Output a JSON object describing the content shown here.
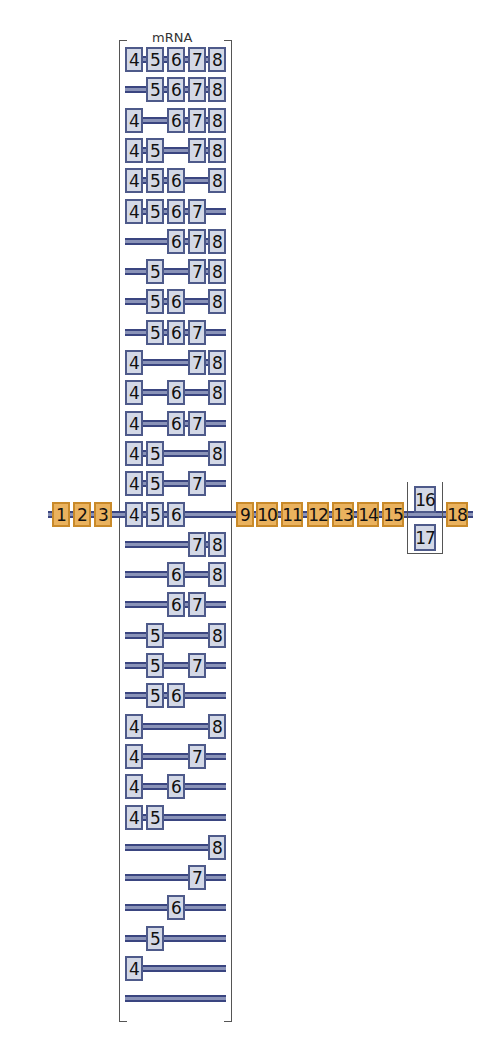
{
  "title": "mRNA",
  "colors": {
    "constitutive_exon": "#eab25e",
    "variable_exon": "#d3d8e6",
    "intron_line": "#3a4580"
  },
  "gene": {
    "constitutive_left": [
      "1",
      "2",
      "3"
    ],
    "constitutive_right": [
      "9",
      "10",
      "11",
      "12",
      "13",
      "14",
      "15"
    ],
    "mutually_exclusive": [
      "16",
      "17"
    ],
    "last_exon": "18"
  },
  "mrna_variants": [
    [
      "4",
      "5",
      "6",
      "7",
      "8"
    ],
    [
      "5",
      "6",
      "7",
      "8"
    ],
    [
      "4",
      "6",
      "7",
      "8"
    ],
    [
      "4",
      "5",
      "7",
      "8"
    ],
    [
      "4",
      "5",
      "6",
      "8"
    ],
    [
      "4",
      "5",
      "6",
      "7"
    ],
    [
      "6",
      "7",
      "8"
    ],
    [
      "5",
      "7",
      "8"
    ],
    [
      "5",
      "6",
      "8"
    ],
    [
      "5",
      "6",
      "7"
    ],
    [
      "4",
      "7",
      "8"
    ],
    [
      "4",
      "6",
      "8"
    ],
    [
      "4",
      "6",
      "7"
    ],
    [
      "4",
      "5",
      "8"
    ],
    [
      "4",
      "5",
      "7"
    ],
    [
      "4",
      "5",
      "6"
    ],
    [
      "7",
      "8"
    ],
    [
      "6",
      "8"
    ],
    [
      "6",
      "7"
    ],
    [
      "5",
      "8"
    ],
    [
      "5",
      "7"
    ],
    [
      "5",
      "6"
    ],
    [
      "4",
      "8"
    ],
    [
      "4",
      "7"
    ],
    [
      "4",
      "6"
    ],
    [
      "4",
      "5"
    ],
    [
      "8"
    ],
    [
      "7"
    ],
    [
      "6"
    ],
    [
      "5"
    ],
    [
      "4"
    ],
    []
  ],
  "main_row_index": 15
}
